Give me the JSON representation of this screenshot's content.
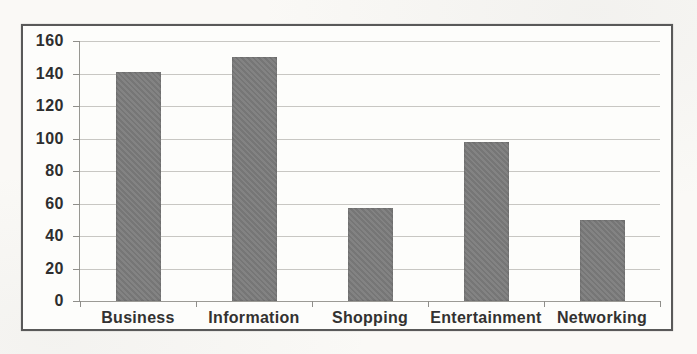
{
  "chart_data": {
    "type": "bar",
    "categories": [
      "Business",
      "Information",
      "Shopping",
      "Entertainment",
      "Networking"
    ],
    "values": [
      141,
      150,
      57,
      98,
      50
    ],
    "title": "",
    "xlabel": "",
    "ylabel": "",
    "ylim": [
      0,
      160
    ],
    "yticks": [
      0,
      20,
      40,
      60,
      80,
      100,
      120,
      140,
      160
    ],
    "grid": true,
    "legend_position": "none",
    "bar_color": "#7c7c7c",
    "gridline_color": "#c2c1bd",
    "axis_color": "#979792",
    "frame_border_color": "#595959",
    "label_color": "#2e2e2e"
  }
}
